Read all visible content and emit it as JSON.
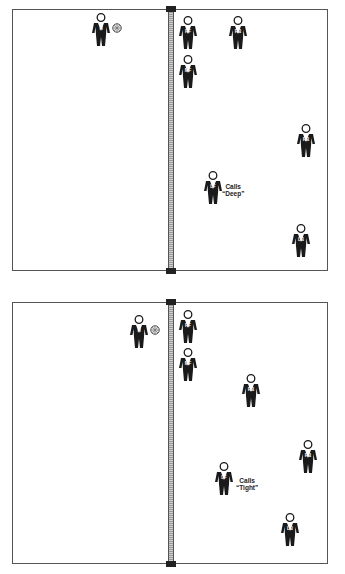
{
  "diagrams": [
    {
      "id": "top",
      "court": {
        "left": 12,
        "top": 9,
        "width": 316,
        "height": 262
      },
      "net": {
        "x": 168,
        "top": 9,
        "bottom": 271
      },
      "players": [
        {
          "label": "H",
          "x": 91,
          "y": 13,
          "has_ball": true
        },
        {
          "label": "RF",
          "x": 178,
          "y": 16
        },
        {
          "label": "RB",
          "x": 228,
          "y": 16
        },
        {
          "label": "MF",
          "x": 178,
          "y": 55
        },
        {
          "label": "RB",
          "x": 296,
          "y": 124
        },
        {
          "label": "LF",
          "x": 203,
          "y": 171,
          "call": "Calls\n“Deep”"
        },
        {
          "label": "LB",
          "x": 291,
          "y": 224
        }
      ],
      "call_text": {
        "line1": "Calls",
        "line2": "“Deep”",
        "x": 226,
        "y": 186
      }
    },
    {
      "id": "bottom",
      "court": {
        "left": 12,
        "top": 302,
        "width": 316,
        "height": 262
      },
      "net": {
        "x": 168,
        "top": 302,
        "bottom": 564
      },
      "players": [
        {
          "label": "H",
          "x": 129,
          "y": 315,
          "has_ball": true
        },
        {
          "label": "RF",
          "x": 178,
          "y": 310
        },
        {
          "label": "MF",
          "x": 178,
          "y": 348
        },
        {
          "label": "RB",
          "x": 241,
          "y": 374
        },
        {
          "label": "RB",
          "x": 298,
          "y": 440
        },
        {
          "label": "LF",
          "x": 214,
          "y": 462
        },
        {
          "label": "LB",
          "x": 280,
          "y": 513
        }
      ],
      "call_text": {
        "line1": "Calls",
        "line2": "“Tight”",
        "x": 237,
        "y": 478
      }
    }
  ],
  "colors": {
    "figure": "#1a1a1a",
    "court_line": "#555555",
    "net": "#aaaaaa",
    "background": "#ffffff"
  }
}
